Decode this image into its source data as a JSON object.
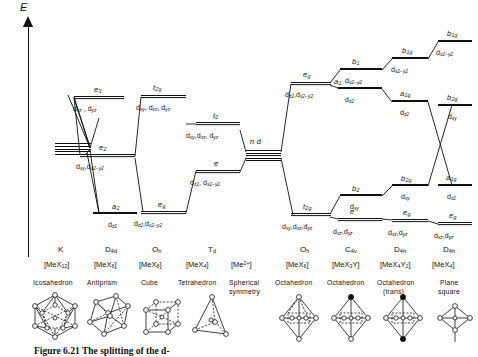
{
  "figure": {
    "axis_label": "E",
    "caption": "Figure 6.21 The splitting of the d-",
    "central_level_label": "n d"
  },
  "columns": [
    {
      "id": "K",
      "point_group": "K",
      "complex": "[MeX12]",
      "geometry": "Icosahedron",
      "shape_icon": "icosahedron-icon",
      "levels": []
    },
    {
      "id": "D4d",
      "point_group": "D4d",
      "complex": "[MeX8]",
      "geometry": "Antiprism",
      "shape_icon": "square-antiprism-icon",
      "levels": [
        {
          "term": "e3",
          "orbitals": "dxz , dyz"
        },
        {
          "term": "e2",
          "orbitals": "dxy, dx2-y2"
        },
        {
          "term": "a2",
          "orbitals": "dz2"
        }
      ]
    },
    {
      "id": "Oh-cube",
      "point_group": "Oh",
      "complex": "[MeX8]",
      "geometry": "Cube",
      "shape_icon": "cube-icon",
      "levels": [
        {
          "term": "t2g",
          "orbitals": "dxy, dxz, dyz"
        },
        {
          "term": "eg",
          "orbitals": "dz2, dx2-y2"
        }
      ]
    },
    {
      "id": "Td",
      "point_group": "Td",
      "complex": "[MeX4]",
      "geometry": "Tetrahedron",
      "shape_icon": "tetrahedron-icon",
      "levels": [
        {
          "term": "t2",
          "orbitals": "dxy, dxz, dyz"
        },
        {
          "term": "e",
          "orbitals": "dz2, dx2-y2"
        }
      ]
    },
    {
      "id": "spherical",
      "point_group": "",
      "complex": "[Me2+]",
      "geometry": "Spherical symmetry",
      "shape_icon": "none",
      "levels": [
        {
          "term": "n d",
          "orbitals": ""
        }
      ]
    },
    {
      "id": "Oh",
      "point_group": "Oh",
      "complex": "[MeX6]",
      "geometry": "Octahedron",
      "shape_icon": "octahedron-icon",
      "levels": [
        {
          "term": "eg",
          "orbitals": "dz2, dx2-y2"
        },
        {
          "term": "t2g",
          "orbitals": "dxy, dxz, dyz"
        }
      ]
    },
    {
      "id": "C4v",
      "point_group": "C4v",
      "complex": "[MeX3Y]",
      "geometry": "Octahedron",
      "shape_icon": "octahedron-c4v-icon",
      "levels": [
        {
          "term": "b1",
          "orbitals": "dx2-y2"
        },
        {
          "term": "a1",
          "orbitals": "dz2"
        },
        {
          "term": "b2",
          "orbitals": "dxy"
        },
        {
          "term": "e",
          "orbitals": "dxz, dyz"
        }
      ]
    },
    {
      "id": "D4h-trans",
      "point_group": "D4h",
      "complex": "[MeX4Y2]",
      "geometry": "Octahedron (trans)",
      "shape_icon": "octahedron-trans-icon",
      "levels": [
        {
          "term": "b1g",
          "orbitals": "dx2-y2"
        },
        {
          "term": "a1g",
          "orbitals": "dz2"
        },
        {
          "term": "b2g",
          "orbitals": "dxy"
        },
        {
          "term": "eg",
          "orbitals": "dxz, dyz"
        }
      ]
    },
    {
      "id": "D4h-square",
      "point_group": "D4h",
      "complex": "[MeX4]",
      "geometry": "Plane square",
      "shape_icon": "square-planar-icon",
      "levels": [
        {
          "term": "b1g",
          "orbitals": "dx2-y2"
        },
        {
          "term": "b2g",
          "orbitals": "dxy"
        },
        {
          "term": "a1g",
          "orbitals": "dz2"
        },
        {
          "term": "eg",
          "orbitals": "dxz, dyz"
        }
      ]
    }
  ]
}
